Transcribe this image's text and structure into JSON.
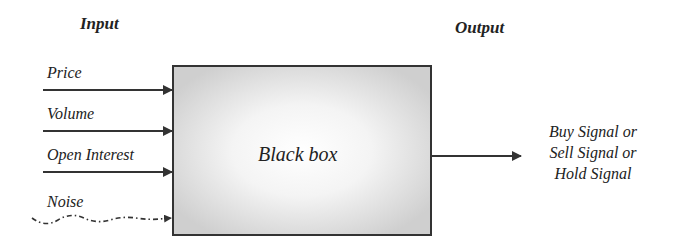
{
  "headings": {
    "input": "Input",
    "output": "Output"
  },
  "inputs": [
    {
      "label": "Price",
      "style": "solid"
    },
    {
      "label": "Volume",
      "style": "solid"
    },
    {
      "label": "Open Interest",
      "style": "solid"
    },
    {
      "label": "Noise",
      "style": "wavy-dash-dot"
    }
  ],
  "box": {
    "label": "Black box",
    "fill_center": "#ffffff",
    "fill_edge": "#d4d4d4",
    "border_color": "#333333"
  },
  "output": {
    "lines": [
      "Buy Signal or",
      "Sell Signal or",
      "Hold Signal"
    ]
  },
  "colors": {
    "stroke": "#333333",
    "text": "#222222"
  }
}
